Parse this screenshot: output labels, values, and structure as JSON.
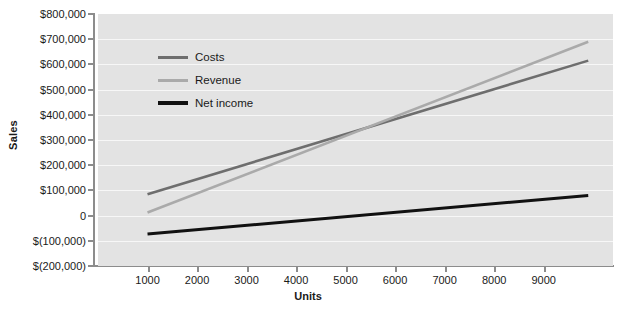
{
  "chart_data": {
    "type": "line",
    "title": "",
    "xlabel": "Units",
    "ylabel": "Sales",
    "xlim": [
      0,
      10400
    ],
    "ylim": [
      -200000,
      800000
    ],
    "grid": true,
    "legend_position": "upper-left-inside",
    "x_ticks": [
      1000,
      2000,
      3000,
      4000,
      5000,
      6000,
      7000,
      8000,
      9000
    ],
    "x_tick_labels": [
      "1000",
      "2000",
      "3000",
      "4000",
      "5000",
      "6000",
      "7000",
      "8000",
      "9000"
    ],
    "y_ticks": [
      800000,
      700000,
      600000,
      500000,
      400000,
      300000,
      200000,
      100000,
      0,
      -100000,
      -200000
    ],
    "y_tick_labels": [
      "$800,000",
      "$700,000",
      "$600,000",
      "$500,000",
      "$400,000",
      "$300,000",
      "$200,000",
      "$100,000",
      "0",
      "$(100,000)",
      "$(200,000)"
    ],
    "x": [
      1000,
      9900
    ],
    "series": [
      {
        "name": "Costs",
        "color": "#6e6e6e",
        "values": [
          85000,
          615000
        ]
      },
      {
        "name": "Revenue",
        "color": "#aaaaaa",
        "values": [
          12000,
          690000
        ]
      },
      {
        "name": "Net income",
        "color": "#111111",
        "values": [
          -73000,
          80000
        ]
      }
    ]
  },
  "legend": {
    "items": [
      {
        "label": "Costs",
        "color": "#6e6e6e"
      },
      {
        "label": "Revenue",
        "color": "#aaaaaa"
      },
      {
        "label": "Net income",
        "color": "#111111"
      }
    ]
  },
  "colors": {
    "plot_background": "#e3e3e3",
    "gridline": "#f7f7f7",
    "axis": "#8c8c8c",
    "text": "#1a1a1a",
    "page_background": "#ffffff"
  }
}
